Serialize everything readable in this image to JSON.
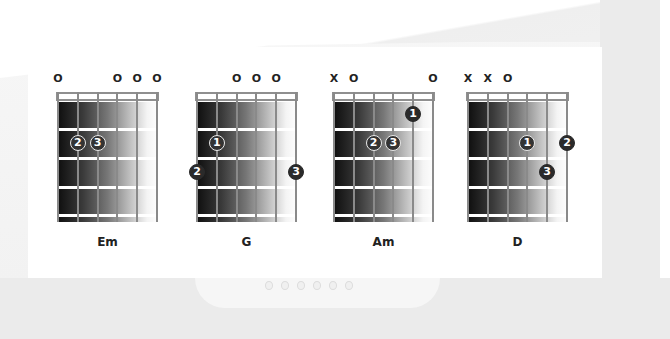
{
  "chords": [
    {
      "name": "Em",
      "left": 58,
      "markers": [
        "O",
        "",
        "",
        "O",
        "O",
        "O"
      ],
      "fingers": [
        {
          "label": "2",
          "string": 1,
          "fret": 2,
          "outlined": true
        },
        {
          "label": "3",
          "string": 2,
          "fret": 2,
          "outlined": true
        }
      ]
    },
    {
      "name": "G",
      "left": 197,
      "markers": [
        "",
        "",
        "O",
        "O",
        "O",
        ""
      ],
      "fingers": [
        {
          "label": "1",
          "string": 1,
          "fret": 2,
          "outlined": true
        },
        {
          "label": "2",
          "string": 0,
          "fret": 3,
          "outlined": false
        },
        {
          "label": "3",
          "string": 5,
          "fret": 3,
          "outlined": false
        }
      ]
    },
    {
      "name": "Am",
      "left": 334,
      "markers": [
        "X",
        "O",
        "",
        "",
        "",
        "O"
      ],
      "fingers": [
        {
          "label": "1",
          "string": 4,
          "fret": 1,
          "outlined": false
        },
        {
          "label": "2",
          "string": 2,
          "fret": 2,
          "outlined": true
        },
        {
          "label": "3",
          "string": 3,
          "fret": 2,
          "outlined": true
        }
      ]
    },
    {
      "name": "D",
      "left": 468,
      "markers": [
        "X",
        "X",
        "O",
        "",
        "",
        ""
      ],
      "fingers": [
        {
          "label": "1",
          "string": 3,
          "fret": 2,
          "outlined": true
        },
        {
          "label": "2",
          "string": 5,
          "fret": 2,
          "outlined": false
        },
        {
          "label": "3",
          "string": 4,
          "fret": 3,
          "outlined": false
        }
      ]
    }
  ],
  "colors": {
    "fretboard_dark": "#0f0f0f",
    "fretboard_light": "#fdfdfd",
    "string": "#8a8a8a",
    "finger_dot": "#2a2a2a",
    "text": "#222222"
  }
}
